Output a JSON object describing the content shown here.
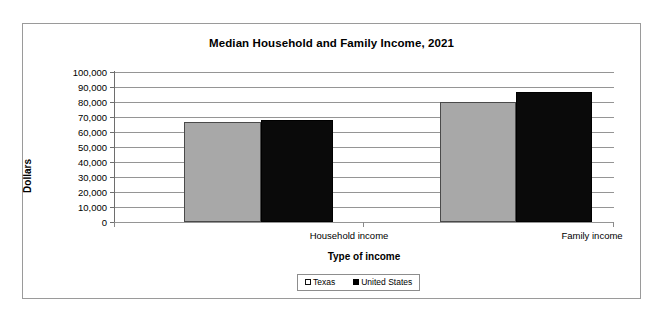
{
  "chart_data": {
    "type": "bar",
    "title": "Median Household and Family Income, 2021",
    "xlabel": "Type of income",
    "ylabel": "Dollars",
    "categories": [
      "Household income",
      "Family income"
    ],
    "series": [
      {
        "name": "Texas",
        "color": "#a8a8a8",
        "values": [
          67000,
          80000
        ]
      },
      {
        "name": "United States",
        "color": "#000000",
        "values": [
          68000,
          87000
        ]
      }
    ],
    "ylim": [
      0,
      100000
    ],
    "yticks": [
      "100,000",
      "90,000",
      "80,000",
      "70,000",
      "60,000",
      "50,000",
      "40,000",
      "30,000",
      "20,000",
      "10,000",
      "0"
    ],
    "ytick_values": [
      100000,
      90000,
      80000,
      70000,
      60000,
      50000,
      40000,
      30000,
      20000,
      10000,
      0
    ],
    "grid": true,
    "legend_position": "bottom",
    "legend": [
      "Texas",
      "United States"
    ]
  }
}
